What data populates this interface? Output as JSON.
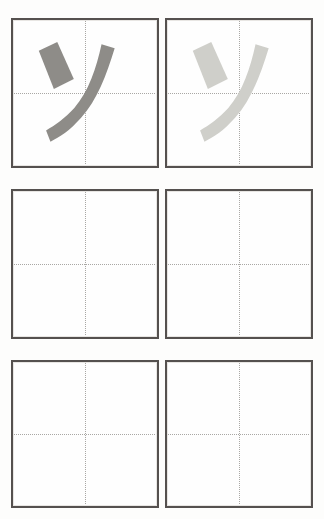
{
  "worksheet": {
    "title": "Katakana stroke practice grid",
    "character": "ソ",
    "character_romaji": "so",
    "background_color": "#fdfdfc",
    "box_border_color": "#55514f",
    "guide_line_color": "#a9a7a4",
    "rows": 3,
    "columns": 2
  },
  "cells": [
    {
      "id": "cell-r1c1",
      "label": "example-dark",
      "filled": true,
      "stroke_color": "#8e8c88",
      "strokes": [
        {
          "name": "stroke-1-short-diagonal",
          "order": 1
        },
        {
          "name": "stroke-2-long-curve",
          "order": 2
        }
      ]
    },
    {
      "id": "cell-r1c2",
      "label": "example-light",
      "filled": true,
      "stroke_color": "#cfcfca",
      "strokes": [
        {
          "name": "stroke-1-short-diagonal",
          "order": 1
        },
        {
          "name": "stroke-2-long-curve",
          "order": 2
        }
      ]
    },
    {
      "id": "cell-r2c1",
      "label": "practice-blank",
      "filled": false,
      "stroke_color": "",
      "strokes": []
    },
    {
      "id": "cell-r2c2",
      "label": "practice-blank",
      "filled": false,
      "stroke_color": "",
      "strokes": []
    },
    {
      "id": "cell-r3c1",
      "label": "practice-blank",
      "filled": false,
      "stroke_color": "",
      "strokes": []
    },
    {
      "id": "cell-r3c2",
      "label": "practice-blank",
      "filled": false,
      "stroke_color": "",
      "strokes": []
    }
  ]
}
